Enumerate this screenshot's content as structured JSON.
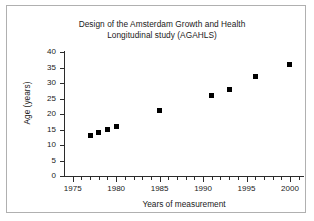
{
  "chart_data": {
    "type": "scatter",
    "title": "Design of the Amsterdam Growth and Health Longitudinal study (AGAHLS)",
    "title_lines": [
      "Design of the Amsterdam Growth and Health",
      "Longitudinal study (AGAHLS)"
    ],
    "xlabel": "Years of measurement",
    "ylabel": "Age (years)",
    "xlim": [
      1974,
      2001.5
    ],
    "ylim": [
      0,
      40
    ],
    "grid": false,
    "legend": null,
    "marker": "square",
    "marker_color": "#000000",
    "x": [
      1977,
      1978,
      1979,
      1980,
      1985,
      1991,
      1993,
      1996,
      2000
    ],
    "y": [
      13,
      14,
      15,
      16,
      21,
      26,
      28,
      32,
      36
    ],
    "points": [
      {
        "x": 1977,
        "y": 13
      },
      {
        "x": 1978,
        "y": 14
      },
      {
        "x": 1979,
        "y": 15
      },
      {
        "x": 1980,
        "y": 16
      },
      {
        "x": 1985,
        "y": 21
      },
      {
        "x": 1991,
        "y": 26
      },
      {
        "x": 1993,
        "y": 28
      },
      {
        "x": 1996,
        "y": 32
      },
      {
        "x": 2000,
        "y": 36
      }
    ],
    "xticks": [
      1975,
      1980,
      1985,
      1990,
      1995,
      2000
    ],
    "xtick_labels": [
      "1975",
      "1980",
      "1985",
      "1990",
      "1995",
      "2000"
    ],
    "xticks_minor_step": 1,
    "yticks": [
      0,
      5,
      10,
      15,
      20,
      25,
      30,
      35,
      40
    ],
    "ytick_labels": [
      "0",
      "5",
      "10",
      "15",
      "20",
      "25",
      "30",
      "35",
      "40"
    ]
  },
  "figure": {
    "background": "#ffffff",
    "border_color": "#b0b0b0",
    "axis_color": "#2b2b2b",
    "text_color": "#1a1a1a"
  }
}
